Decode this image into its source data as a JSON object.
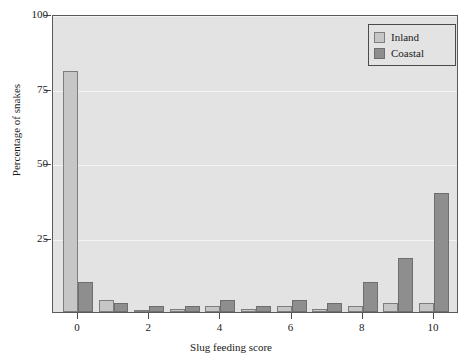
{
  "chart_data": {
    "type": "bar",
    "title": "",
    "xlabel": "Slug feeding score",
    "ylabel": "Percentage of snakes",
    "categories": [
      "0",
      "1",
      "2",
      "3",
      "4",
      "5",
      "6",
      "7",
      "8",
      "9",
      "10"
    ],
    "series": [
      {
        "name": "Inland",
        "color": "#c6c6c6",
        "values": [
          81,
          4,
          0.3,
          1,
          2,
          1,
          2,
          1,
          2,
          3,
          3
        ]
      },
      {
        "name": "Coastal",
        "color": "#8e8e8e",
        "values": [
          10,
          3,
          2,
          2,
          4,
          2,
          4,
          3,
          10,
          18,
          40
        ]
      }
    ],
    "xlim": [
      -0.7,
      10.7
    ],
    "ylim": [
      0,
      100
    ],
    "yticks": [
      0,
      25,
      50,
      75,
      100
    ],
    "ytick_labels": [
      "",
      "25",
      "50",
      "75",
      "100"
    ],
    "xticks": [
      0,
      2,
      4,
      6,
      8,
      10
    ],
    "xtick_labels": [
      "0",
      "2",
      "4",
      "6",
      "8",
      "10"
    ],
    "grid": true,
    "grid_color": "#f4f4f4",
    "plot_background": "#e3e3e3",
    "legend_position": "top-right"
  },
  "legend": {
    "entries": [
      {
        "label": "Inland",
        "icon": "square-swatch-icon"
      },
      {
        "label": "Coastal",
        "icon": "square-swatch-icon"
      }
    ]
  }
}
